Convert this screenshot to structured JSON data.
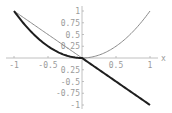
{
  "chart_data": {
    "type": "line",
    "title": "",
    "xlabel": "x",
    "ylabel": "",
    "xlim": [
      -1,
      1
    ],
    "ylim": [
      -1,
      1
    ],
    "grid": false,
    "legend": "none",
    "x_ticks": [
      {
        "value": -1,
        "label": "-1"
      },
      {
        "value": -0.5,
        "label": "-0.5"
      },
      {
        "value": 0.5,
        "label": "0.5"
      },
      {
        "value": 1,
        "label": "1"
      }
    ],
    "y_ticks": [
      {
        "value": 1,
        "label": "1"
      },
      {
        "value": 0.75,
        "label": "0.75"
      },
      {
        "value": 0.5,
        "label": "0.5"
      },
      {
        "value": 0.25,
        "label": "0.25"
      },
      {
        "value": -0.25,
        "label": "0.25"
      },
      {
        "value": -0.5,
        "label": "-0.5"
      },
      {
        "value": -0.75,
        "label": "-0.75"
      },
      {
        "value": -1,
        "label": "-1"
      }
    ],
    "series": [
      {
        "name": "thin-gray-curve",
        "description": "y = -x for x<0, y = x^2 for x>=0",
        "color": "#8a8a8a",
        "x": [
          -1,
          -0.75,
          -0.5,
          -0.25,
          0,
          0.25,
          0.5,
          0.75,
          1
        ],
        "y": [
          1,
          0.75,
          0.5,
          0.25,
          0,
          0.0625,
          0.25,
          0.5625,
          1
        ]
      },
      {
        "name": "thick-black-curve",
        "description": "y = x^2 for x<0, y = -x for x>=0",
        "color": "#1e1e1e",
        "x": [
          -1,
          -0.75,
          -0.5,
          -0.25,
          0,
          0.25,
          0.5,
          0.75,
          1
        ],
        "y": [
          1,
          0.5625,
          0.25,
          0.0625,
          0,
          -0.25,
          -0.5,
          -0.75,
          -1
        ]
      }
    ]
  }
}
